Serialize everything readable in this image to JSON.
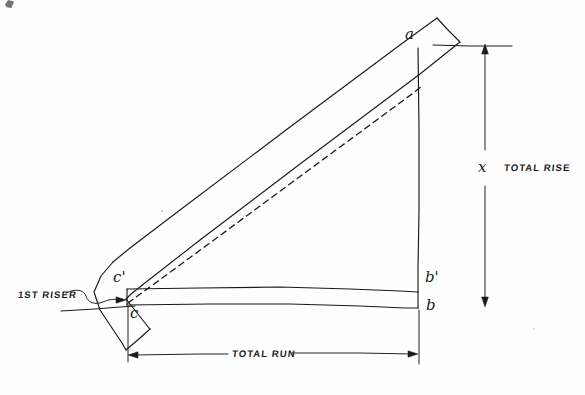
{
  "diagram": {
    "kind": "hand-drawn-sketch",
    "ink_color": "#1a1a1a",
    "paper_color": "#fefefe",
    "labels": {
      "point_a": "a",
      "point_b": "b",
      "point_b_prime": "b'",
      "point_c": "c",
      "point_c_prime": "c'",
      "rise_variable": "x",
      "total_rise": "TOTAL RISE",
      "total_run": "TOTAL RUN",
      "first_riser": "1ST RISER"
    },
    "elements": [
      {
        "name": "stringer-board",
        "description": "long diagonal board with two parallel edges and square-cut ends"
      },
      {
        "name": "center-dash-line",
        "description": "dashed layout line from c to a"
      },
      {
        "name": "riser-band",
        "description": "horizontal band between c'-b' and c-b"
      },
      {
        "name": "total-rise-dimension",
        "description": "vertical dimension line with arrows at both ends"
      },
      {
        "name": "total-run-dimension",
        "description": "horizontal dimension line with arrows at both ends"
      },
      {
        "name": "first-riser-leader",
        "description": "squiggle leader line with arrow pointing at the first riser"
      },
      {
        "name": "upper-datum-line",
        "description": "horizontal reference line at top of rise"
      },
      {
        "name": "lower-datum-line",
        "description": "horizontal reference line at floor level"
      }
    ]
  }
}
